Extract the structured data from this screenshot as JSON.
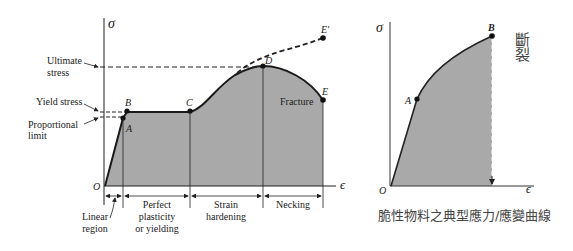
{
  "left_diagram": {
    "y_axis_symbol": "σ",
    "x_axis_symbol": "ϵ",
    "origin_label": "O",
    "stress_labels": {
      "ultimate_stress": [
        "Ultimate",
        "stress"
      ],
      "yield_stress": "Yield stress",
      "proportional_limit": [
        "Proportional",
        "limit"
      ]
    },
    "points": {
      "A": "A",
      "B": "B",
      "C": "C",
      "D": "D",
      "E": "E",
      "E_prime": "E'"
    },
    "fracture_label": "Fracture",
    "regions": {
      "linear": [
        "Linear",
        "region"
      ],
      "perfect_plasticity": [
        "Perfect",
        "plasticity",
        "or yielding"
      ],
      "strain_hardening": [
        "Strain",
        "hardening"
      ],
      "necking": "Necking"
    }
  },
  "right_diagram": {
    "y_axis_symbol": "σ",
    "x_axis_symbol": "ϵ",
    "origin_label": "O",
    "points": {
      "A": "A",
      "B": "B"
    },
    "fracture_label_vertical": [
      "斷",
      "裂"
    ],
    "caption": "脆性物料之典型應力/應變曲線"
  },
  "colors": {
    "fill": "#a9a9a9",
    "line": "#1a1a1a",
    "caption_text": "#444444"
  }
}
